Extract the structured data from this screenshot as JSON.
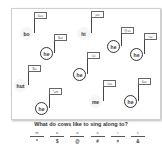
{
  "notes": [
    {
      "x": 20,
      "y": 27,
      "ring": false,
      "word": "bo",
      "flag": "&=u",
      "fx": 35,
      "fy": 12
    },
    {
      "x": 77,
      "y": 27,
      "ring": false,
      "word": "hi",
      "flag": "j=o",
      "fx": 87,
      "fy": 11
    },
    {
      "x": 40,
      "y": 47,
      "ring": true,
      "word": "he",
      "flag": "$=o",
      "fx": 58,
      "fy": 34
    },
    {
      "x": 107,
      "y": 40,
      "ring": true,
      "word": "he",
      "flag": "@=s",
      "fx": 117,
      "fy": 27
    },
    {
      "x": 130,
      "y": 48,
      "ring": true,
      "word": "he",
      "flag": "×=c",
      "fx": 143,
      "fy": 33
    },
    {
      "x": 73,
      "y": 68,
      "ring": true,
      "word": "he",
      "flag": "#=i",
      "fx": 87,
      "fy": 52
    },
    {
      "x": 14,
      "y": 79,
      "ring": false,
      "word": "hut",
      "flag": "$=i",
      "fx": 29,
      "fy": 65
    },
    {
      "x": 35,
      "y": 102,
      "ring": true,
      "word": "he",
      "flag": "*=m",
      "fx": 48,
      "fy": 88
    },
    {
      "x": 89,
      "y": 95,
      "ring": false,
      "word": "me",
      "flag": "#=u",
      "fx": 100,
      "fy": 80
    },
    {
      "x": 124,
      "y": 95,
      "ring": true,
      "word": "he",
      "flag": "&=c",
      "fx": 137,
      "fy": 78
    }
  ],
  "question": "What do cows like to sing along to?",
  "answer": [
    {
      "letter": "m",
      "symbol": "*"
    },
    {
      "letter": "o",
      "symbol": "$"
    },
    {
      "letter": "o",
      "symbol": "@"
    },
    {
      "letter": "s",
      "symbol": "#"
    },
    {
      "letter": "i",
      "symbol": "×"
    },
    {
      "letter": "c",
      "symbol": "&"
    }
  ]
}
